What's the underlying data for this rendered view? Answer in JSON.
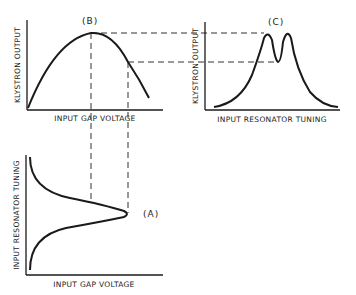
{
  "panels": {
    "b": {
      "tag": "(B)",
      "ylabel": "KLYSTRON OUTPUT",
      "xlabel": "INPUT GAP VOLTAGE"
    },
    "c": {
      "tag": "(C)",
      "ylabel": "KLYSTRON OUTPUT",
      "xlabel": "INPUT RESONATOR TUNING"
    },
    "a": {
      "tag": "(A)",
      "ylabel": "INPUT RESONATOR TUNING",
      "xlabel": "INPUT GAP VOLTAGE"
    }
  },
  "colors": {
    "ink": "#1a1a1a",
    "background": "#ffffff"
  }
}
